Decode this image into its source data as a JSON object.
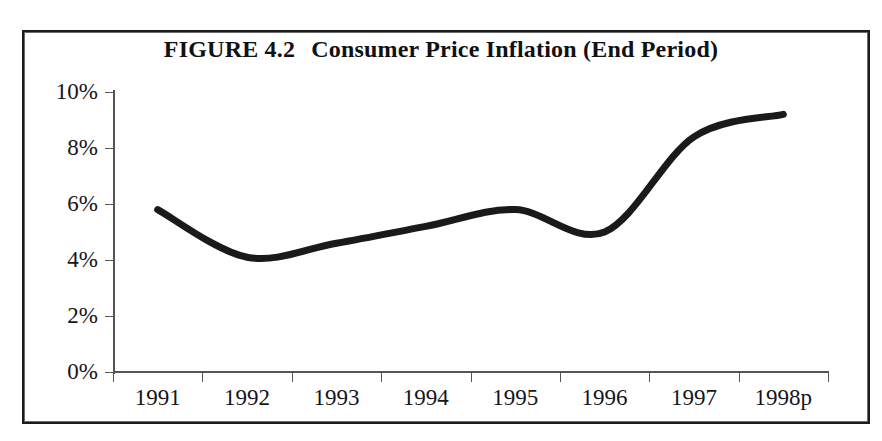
{
  "figure": {
    "label": "FIGURE 4.2",
    "title": "Consumer Price Inflation (End Period)"
  },
  "axis": {
    "y_ticks": [
      "10%",
      "8%",
      "6%",
      "4%",
      "2%",
      "0%"
    ],
    "x_ticks": [
      "1991",
      "1992",
      "1993",
      "1994",
      "1995",
      "1996",
      "1997",
      "1998p"
    ]
  },
  "style": {
    "line_color": "#1a1a1a",
    "axis_color": "#55545a",
    "frame_color": "#1c1c1c",
    "background": "#ffffff"
  },
  "chart_data": {
    "type": "line",
    "xlabel": "",
    "ylabel": "",
    "categories": [
      "1991",
      "1992",
      "1993",
      "1994",
      "1995",
      "1996",
      "1997",
      "1998p"
    ],
    "values": [
      5.8,
      4.1,
      4.6,
      5.2,
      5.8,
      5.0,
      8.4,
      9.2
    ],
    "value_unit": "percent",
    "ylim": [
      0,
      10
    ],
    "ytick_values": [
      0,
      2,
      4,
      6,
      8,
      10
    ],
    "ytick_labels": [
      "0%",
      "2%",
      "4%",
      "6%",
      "8%",
      "10%"
    ],
    "grid": false,
    "legend": false,
    "smoothing": "spline",
    "series": [
      {
        "name": "Consumer Price Inflation (End Period)",
        "values": [
          5.8,
          4.1,
          4.6,
          5.2,
          5.8,
          5.0,
          8.4,
          9.2
        ]
      }
    ]
  }
}
